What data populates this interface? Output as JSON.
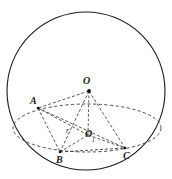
{
  "figure": {
    "kind": "geometry-diagram",
    "background_color": "#ffffff",
    "stroke_color": "#1b1b1b",
    "dash_color": "#3a3a3a",
    "canvas": {
      "width": 172,
      "height": 179
    }
  },
  "labels": {
    "sphere_center": "O",
    "circle_center": "O",
    "circle_center_sub": "1",
    "vertex_a": "A",
    "vertex_b": "B",
    "vertex_c": "C",
    "radius": "r"
  },
  "geometry": {
    "sphere": {
      "cx": 86,
      "cy": 91,
      "r": 80,
      "style": "solid"
    },
    "cross_section_ellipse": {
      "cx": 87,
      "cy": 128,
      "rx": 74,
      "ry": 24,
      "style": "dashed"
    },
    "points": {
      "O": {
        "x": 89,
        "y": 91,
        "marker": "dot"
      },
      "O1": {
        "x": 88,
        "y": 135,
        "marker": "none"
      },
      "A": {
        "x": 38,
        "y": 108,
        "marker": "dot"
      },
      "B": {
        "x": 60,
        "y": 152,
        "marker": "dot"
      },
      "C": {
        "x": 125,
        "y": 148,
        "marker": "dot"
      }
    },
    "segments": [
      {
        "name": "O-A",
        "from": "O",
        "to": "A",
        "style": "dashed"
      },
      {
        "name": "O-B",
        "from": "O",
        "to": "B",
        "style": "dashed"
      },
      {
        "name": "O-C",
        "from": "O",
        "to": "C",
        "style": "dashed"
      },
      {
        "name": "O-O1",
        "from": "O",
        "to": "O1",
        "style": "dashed"
      },
      {
        "name": "O1-A",
        "from": "O1",
        "to": "A",
        "style": "dashed"
      },
      {
        "name": "O1-B",
        "from": "O1",
        "to": "B",
        "style": "dashed"
      },
      {
        "name": "O1-C",
        "from": "O1",
        "to": "C",
        "style": "dashed"
      },
      {
        "name": "A-B",
        "from": "A",
        "to": "B",
        "style": "dashed"
      },
      {
        "name": "A-C",
        "from": "A",
        "to": "C",
        "style": "dashed"
      },
      {
        "name": "B-C",
        "from": "B",
        "to": "C",
        "style": "dashed"
      }
    ],
    "label_positions": {
      "O": {
        "x": 83,
        "y": 78
      },
      "O1": {
        "x": 86,
        "y": 130
      },
      "A": {
        "x": 30,
        "y": 98
      },
      "B": {
        "x": 57,
        "y": 157
      },
      "C": {
        "x": 124,
        "y": 153
      },
      "r": {
        "x": 66,
        "y": 130
      }
    }
  }
}
